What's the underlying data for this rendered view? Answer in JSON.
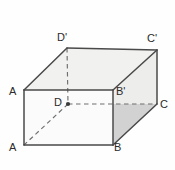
{
  "figure": {
    "name": "rectangular-prism-cuboid",
    "background_color": "#fefefe",
    "solid_edge_color": "#4a4a4a",
    "hidden_edge_color": "#6f6f6f",
    "top_face_fill": "#f1f1ef",
    "back_face_fill": "#ededeb",
    "base_face_fill": "#d2d2d2",
    "front_face_fill": "#fbfbfb",
    "label_color": "#2b2b2b"
  },
  "vertices": [
    {
      "id": "A-top",
      "label": "A",
      "x": 24,
      "y": 90,
      "label_x": 9,
      "label_y": 86,
      "hidden": false
    },
    {
      "id": "B-prime",
      "label": "B'",
      "x": 113,
      "y": 90,
      "label_x": 116,
      "label_y": 86,
      "hidden": false
    },
    {
      "id": "C-prime",
      "label": "C'",
      "x": 157,
      "y": 50,
      "label_x": 147,
      "label_y": 33,
      "hidden": false
    },
    {
      "id": "D-prime",
      "label": "D'",
      "x": 67,
      "y": 48,
      "label_x": 57,
      "label_y": 32,
      "hidden": false
    },
    {
      "id": "A-bottom",
      "label": "A",
      "x": 24,
      "y": 145,
      "label_x": 9,
      "label_y": 142,
      "hidden": false
    },
    {
      "id": "B-bottom",
      "label": "B",
      "x": 113,
      "y": 145,
      "label_x": 114,
      "label_y": 142,
      "hidden": false
    },
    {
      "id": "C-right",
      "label": "C",
      "x": 157,
      "y": 104,
      "label_x": 160,
      "label_y": 99,
      "hidden": false
    },
    {
      "id": "D-hidden",
      "label": "D",
      "x": 68,
      "y": 104,
      "label_x": 54,
      "label_y": 97,
      "hidden": true
    }
  ],
  "edges": {
    "solid": [
      {
        "name": "edge-A-top-to-B-prime",
        "x1": 24,
        "y1": 90,
        "x2": 113,
        "y2": 90
      },
      {
        "name": "edge-A-top-to-D-prime",
        "x1": 24,
        "y1": 90,
        "x2": 67,
        "y2": 48
      },
      {
        "name": "edge-D-prime-to-C-prime",
        "x1": 67,
        "y1": 48,
        "x2": 157,
        "y2": 50
      },
      {
        "name": "edge-B-prime-to-C-prime",
        "x1": 113,
        "y1": 90,
        "x2": 157,
        "y2": 50
      },
      {
        "name": "edge-C-prime-to-C",
        "x1": 157,
        "y1": 50,
        "x2": 157,
        "y2": 104
      },
      {
        "name": "edge-A-top-to-A-bottom",
        "x1": 24,
        "y1": 90,
        "x2": 24,
        "y2": 145
      },
      {
        "name": "edge-B-prime-to-B",
        "x1": 113,
        "y1": 90,
        "x2": 113,
        "y2": 145
      },
      {
        "name": "edge-A-bottom-to-B",
        "x1": 24,
        "y1": 145,
        "x2": 113,
        "y2": 145
      },
      {
        "name": "edge-B-to-C",
        "x1": 113,
        "y1": 145,
        "x2": 157,
        "y2": 104
      }
    ],
    "dashed": [
      {
        "name": "hidden-edge-D-prime-to-D",
        "x1": 67,
        "y1": 48,
        "x2": 68,
        "y2": 104
      },
      {
        "name": "hidden-edge-D-to-C",
        "x1": 68,
        "y1": 104,
        "x2": 157,
        "y2": 104
      },
      {
        "name": "hidden-edge-D-to-A-bottom",
        "x1": 68,
        "y1": 104,
        "x2": 24,
        "y2": 145
      }
    ]
  },
  "faces": [
    {
      "name": "top-face",
      "points": "24,90 67,48 157,50 113,90",
      "fill": "#f1f1ef"
    },
    {
      "name": "back-face",
      "points": "113,90 157,50 157,104 113,104",
      "fill": "#ededeb"
    },
    {
      "name": "base-face",
      "points": "24,145 68,104 157,104 113,145",
      "fill": "#d2d2d2"
    },
    {
      "name": "front-face",
      "points": "24,90 113,90 113,145 24,145",
      "fill": "#fbfbfb"
    }
  ],
  "markers": [
    {
      "name": "vertex-dot-D",
      "x": 68,
      "y": 104,
      "r": 2.1,
      "color": "#3a3a3a"
    }
  ]
}
